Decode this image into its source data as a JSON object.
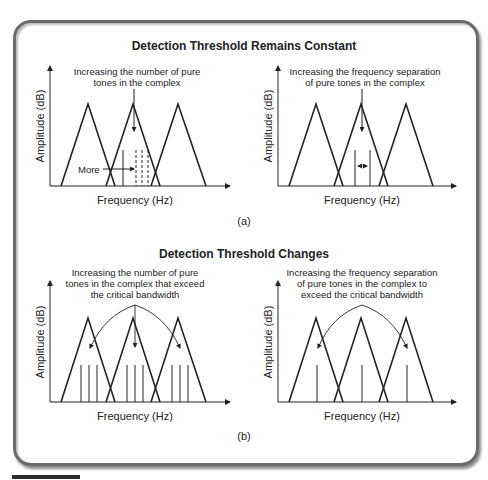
{
  "figure": {
    "panel_a": {
      "title": "Detection Threshold Remains Constant",
      "label": "(a)",
      "left_graph": {
        "annotation_lines": [
          "Increasing the number of pure",
          "tones in the complex"
        ],
        "inline_label": "More",
        "xlabel": "Frequency (Hz)",
        "ylabel": "Amplitude (dB)"
      },
      "right_graph": {
        "annotation_lines": [
          "Increasing the frequency separation",
          "of pure tones in the complex"
        ],
        "xlabel": "Frequency (Hz)",
        "ylabel": "Amplitude (dB)"
      }
    },
    "panel_b": {
      "title": "Detection Threshold Changes",
      "label": "(b)",
      "left_graph": {
        "annotation_lines": [
          "Increasing the number of pure",
          "tones in the complex that exceed",
          "the critical bandwidth"
        ],
        "xlabel": "Frequency (Hz)",
        "ylabel": "Amplitude (dB)"
      },
      "right_graph": {
        "annotation_lines": [
          "Increasing the frequency separation",
          "of pure tones in the complex to",
          "exceed the critical bandwidth"
        ],
        "xlabel": "Frequency (Hz)",
        "ylabel": "Amplitude (dB)"
      }
    },
    "colors": {
      "stroke": "#222222",
      "frame": "#6a6a6a"
    }
  }
}
